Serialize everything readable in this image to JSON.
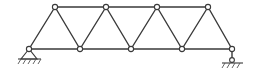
{
  "diagram": {
    "type": "truss",
    "colors": {
      "line": "#3a3a3a",
      "node_fill": "#ffffff",
      "background": "#ffffff"
    },
    "nodes": {
      "top": [
        {
          "id": "T1",
          "x": 55,
          "y": 7
        },
        {
          "id": "T2",
          "x": 106,
          "y": 7
        },
        {
          "id": "T3",
          "x": 157,
          "y": 7
        },
        {
          "id": "T4",
          "x": 208,
          "y": 7
        }
      ],
      "bottom": [
        {
          "id": "B1",
          "x": 29,
          "y": 49
        },
        {
          "id": "B2",
          "x": 80,
          "y": 49
        },
        {
          "id": "B3",
          "x": 131,
          "y": 49
        },
        {
          "id": "B4",
          "x": 182,
          "y": 49
        },
        {
          "id": "B5",
          "x": 232,
          "y": 49
        }
      ]
    },
    "members": [
      [
        "T1",
        "T2"
      ],
      [
        "T2",
        "T3"
      ],
      [
        "T3",
        "T4"
      ],
      [
        "B1",
        "B2"
      ],
      [
        "B2",
        "B3"
      ],
      [
        "B3",
        "B4"
      ],
      [
        "B4",
        "B5"
      ],
      [
        "B1",
        "T1"
      ],
      [
        "T1",
        "B2"
      ],
      [
        "B2",
        "T2"
      ],
      [
        "T2",
        "B3"
      ],
      [
        "B3",
        "T3"
      ],
      [
        "T3",
        "B4"
      ],
      [
        "B4",
        "T4"
      ],
      [
        "T4",
        "B5"
      ]
    ],
    "supports": [
      {
        "node": "B1",
        "type": "pin"
      },
      {
        "node": "B5",
        "type": "roller-link"
      }
    ]
  }
}
